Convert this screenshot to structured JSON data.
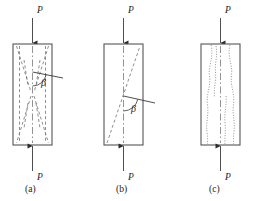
{
  "figure": {
    "stroke_colors": {
      "specimen_outline": "#555555",
      "crack_dashed": "#7a7a7a",
      "crack_dotted": "#8a8a8a",
      "centerline": "#777777",
      "load_arrow": "#3a3a3a",
      "text": "#1a1a1a",
      "background": "#ffffff"
    },
    "panels": [
      {
        "id": "a",
        "caption": "(a)",
        "caption_x": 32,
        "caption_y": 190,
        "failure_mode": "cone-and-split / hourglass shear cracking",
        "specimen": {
          "x": 13,
          "y": 44,
          "width": 39,
          "height": 101
        },
        "load_top_label": "P",
        "load_top_label_x": 37,
        "load_top_label_y": 13,
        "load_bottom_label": "P",
        "load_bottom_label_x": 37,
        "load_bottom_label_y": 178,
        "angle_label": "β",
        "angle_label_x": 41,
        "angle_label_y": 85,
        "angle_vertex_x": 32.5,
        "angle_vertex_y": 72,
        "angle_arm_x": 63,
        "angle_arm_y": 78
      },
      {
        "id": "b",
        "caption": "(b)",
        "caption_x": 123,
        "caption_y": 190,
        "failure_mode": "single inclined shear plane",
        "specimen": {
          "x": 104,
          "y": 44,
          "width": 39,
          "height": 101
        },
        "load_top_label": "P",
        "load_top_label_x": 128,
        "load_top_label_y": 13,
        "load_bottom_label": "P",
        "load_bottom_label_x": 128,
        "load_bottom_label_y": 178,
        "angle_label": "β",
        "angle_label_x": 131,
        "angle_label_y": 110,
        "angle_vertex_x": 123.5,
        "angle_vertex_y": 96,
        "angle_arm_x": 155,
        "angle_arm_y": 103,
        "shear_line": {
          "x1": 108,
          "y1": 143,
          "x2": 140,
          "y2": 46
        }
      },
      {
        "id": "c",
        "caption": "(c)",
        "caption_x": 216,
        "caption_y": 190,
        "failure_mode": "vertical splitting / columnar cracking",
        "specimen": {
          "x": 201,
          "y": 44,
          "width": 39,
          "height": 101
        },
        "load_top_label": "P",
        "load_top_label_x": 225,
        "load_top_label_y": 13,
        "load_bottom_label": "P",
        "load_bottom_label_x": 225,
        "load_bottom_label_y": 178
      }
    ],
    "labels": {
      "load_symbol": "P",
      "angle_symbol": "β"
    },
    "icons": {
      "arrow_down": "down-arrow-icon",
      "arrow_up": "up-arrow-icon"
    }
  }
}
